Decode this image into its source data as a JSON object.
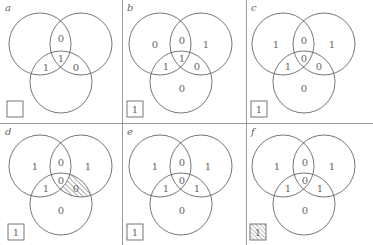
{
  "figure": {
    "panels": [
      {
        "label": "a",
        "regions": {
          "A": "",
          "B": "",
          "C": "",
          "AB": "0",
          "AC": "1",
          "BC": "0",
          "ABC": "1"
        },
        "box": {
          "value": "",
          "hatched": false
        },
        "hatched_region": null
      },
      {
        "label": "b",
        "regions": {
          "A": "0",
          "B": "1",
          "C": "0",
          "AB": "0",
          "AC": "1",
          "BC": "0",
          "ABC": "1"
        },
        "box": {
          "value": "1",
          "hatched": false
        },
        "hatched_region": null
      },
      {
        "label": "c",
        "regions": {
          "A": "1",
          "B": "1",
          "C": "0",
          "AB": "0",
          "AC": "1",
          "BC": "0",
          "ABC": "0"
        },
        "box": {
          "value": "1",
          "hatched": false
        },
        "hatched_region": null
      },
      {
        "label": "d",
        "regions": {
          "A": "1",
          "B": "1",
          "C": "0",
          "AB": "0",
          "AC": "1",
          "BC": "0",
          "ABC": "0"
        },
        "box": {
          "value": "1",
          "hatched": false
        },
        "hatched_region": "BC"
      },
      {
        "label": "e",
        "regions": {
          "A": "1",
          "B": "1",
          "C": "0",
          "AB": "0",
          "AC": "1",
          "BC": "1",
          "ABC": "0"
        },
        "box": {
          "value": "1",
          "hatched": false
        },
        "hatched_region": null
      },
      {
        "label": "f",
        "regions": {
          "A": "1",
          "B": "1",
          "C": "0",
          "AB": "0",
          "AC": "1",
          "BC": "1",
          "ABC": "0"
        },
        "box": {
          "value": "1",
          "hatched": true
        },
        "hatched_region": null
      }
    ]
  }
}
